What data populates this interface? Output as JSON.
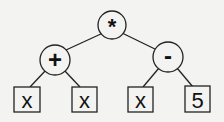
{
  "diagram": {
    "type": "expression-tree",
    "background": "#f3f3f1",
    "nodes": {
      "root": {
        "label": "*",
        "shape": "circle"
      },
      "plus": {
        "label": "+",
        "shape": "circle"
      },
      "minus": {
        "label": "-",
        "shape": "circle"
      },
      "leaf1": {
        "label": "x",
        "shape": "box"
      },
      "leaf2": {
        "label": "x",
        "shape": "box"
      },
      "leaf3": {
        "label": "x",
        "shape": "box"
      },
      "leaf4": {
        "label": "5",
        "shape": "box"
      }
    },
    "edges": [
      [
        "*",
        "+"
      ],
      [
        "*",
        "-"
      ],
      [
        "+",
        "x"
      ],
      [
        "+",
        "x"
      ],
      [
        "-",
        "x"
      ],
      [
        "-",
        "5"
      ]
    ]
  }
}
